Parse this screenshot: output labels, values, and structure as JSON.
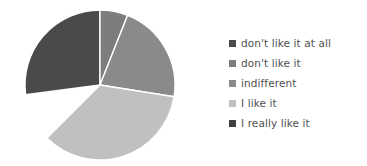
{
  "chart_data": {
    "type": "pie",
    "title": "",
    "labels": [
      "don't like it at all",
      "don't like it",
      "indifferent",
      "I like it",
      "I really like it"
    ],
    "values": [
      37.5,
      6.0,
      21.5,
      35.0,
      0.0
    ],
    "units": "percent",
    "start_angle_deg": 0,
    "direction": "clockwise",
    "colors": [
      "#4a4a4a",
      "#7d7d7d",
      "#8a8a8a",
      "#c0c0c0",
      "#3f3f3f"
    ],
    "slice_border_color": "#ffffff",
    "legend_position": "right",
    "grid": false,
    "data_labels_shown": false,
    "slices": [
      {
        "label": "don't like it at all",
        "value": 37.5,
        "color": "#4a4a4a",
        "start_deg": 262.5,
        "end_deg": 360.0
      },
      {
        "label": "don't like it",
        "value": 6.0,
        "color": "#7d7d7d",
        "start_deg": 0.0,
        "end_deg": 21.6
      },
      {
        "label": "indifferent",
        "value": 21.5,
        "color": "#8a8a8a",
        "start_deg": 21.6,
        "end_deg": 99.0
      },
      {
        "label": "I like it",
        "value": 35.0,
        "color": "#c0c0c0",
        "start_deg": 99.0,
        "end_deg": 225.0
      },
      {
        "label": "I really like it",
        "value": 0.0,
        "color": "#3f3f3f",
        "start_deg": 225.0,
        "end_deg": 225.0
      }
    ]
  },
  "legend": {
    "items": [
      {
        "label": "don't like it at all",
        "color": "#4a4a4a"
      },
      {
        "label": "don't like it",
        "color": "#7d7d7d"
      },
      {
        "label": "indifferent",
        "color": "#8a8a8a"
      },
      {
        "label": "I like it",
        "color": "#c0c0c0"
      },
      {
        "label": "I really like it",
        "color": "#3f3f3f"
      }
    ]
  },
  "figure": {
    "background": "#ffffff",
    "pie_center_x": 100,
    "pie_center_y": 85,
    "pie_radius": 75
  }
}
